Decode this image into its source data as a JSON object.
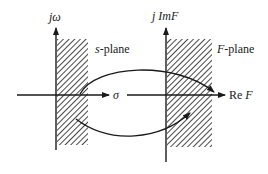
{
  "diagram": {
    "type": "conformal-mapping",
    "left_plane": {
      "label": "s-plane",
      "label_italic_part": "s",
      "label_rest": "-plane",
      "vertical_axis_label": "jω",
      "horizontal_axis_label": "σ",
      "shaded_region": "right half-plane strip adjacent to imaginary axis"
    },
    "right_plane": {
      "label": "F-plane",
      "label_italic_part": "F",
      "label_rest": "-plane",
      "vertical_axis_label_prefix": "j Im",
      "vertical_axis_label_var": "F",
      "horizontal_axis_label_prefix": "Re",
      "horizontal_axis_label_var": "F",
      "shaded_region": "right half-plane strip adjacent to imaginary axis"
    },
    "mappings": [
      {
        "name": "upper-arrow",
        "from": "s-plane real axis",
        "to": "F-plane Re F axis"
      },
      {
        "name": "lower-arrow",
        "from": "s-plane shaded region",
        "to": "F-plane shaded region"
      }
    ],
    "colors": {
      "line": "#1a1a1a",
      "background": "#ffffff"
    }
  }
}
